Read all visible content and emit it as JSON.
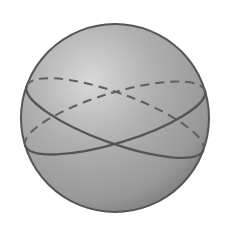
{
  "diagram": {
    "type": "sphere-with-great-circles",
    "sphere": {
      "cx": 115,
      "cy": 118,
      "r": 94,
      "highlight_color": "#d6d6d6",
      "mid_color": "#a9a9a9",
      "edge_color": "#7d7d7d",
      "outline_color": "#555555"
    },
    "great_circles": [
      {
        "name": "great-circle-1",
        "rx": 94,
        "ry": 25,
        "rotation": 20,
        "front_style": "solid",
        "back_style": "dashed",
        "stroke": "#5a5a5a"
      },
      {
        "name": "great-circle-2",
        "rx": 94,
        "ry": 25,
        "rotation": -17,
        "front_style": "solid",
        "back_style": "dashed",
        "stroke": "#5a5a5a"
      }
    ]
  }
}
